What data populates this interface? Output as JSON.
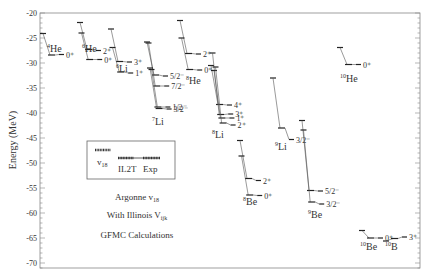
{
  "chart_data": {
    "type": "level-diagram",
    "title": "",
    "ylabel": "Energy (MeV)",
    "xlabel": "",
    "ylim": [
      -72,
      -20
    ],
    "yticks": [
      -20,
      -25,
      -30,
      -35,
      -40,
      -45,
      -50,
      -55,
      -60,
      -65,
      -70
    ],
    "legend": {
      "entries": [
        "v18",
        "IL2T",
        "Exp"
      ],
      "v18_label": "v",
      "v18_sub": "18",
      "il2t_label": "IL2T",
      "exp_label": "Exp"
    },
    "annotations": {
      "line1": "Argonne v",
      "line1_sub": "18",
      "line2": "With Illinois V",
      "line2_sub": "ijk",
      "line3": "GFMC Calculations"
    },
    "nuclei": [
      {
        "name": "4He",
        "mass": "4",
        "element": "He",
        "levels": [
          {
            "J": "0+",
            "v18": -24.1,
            "IL2T": -28.4,
            "Exp": -28.3
          }
        ]
      },
      {
        "name": "6He",
        "mass": "6",
        "element": "He",
        "levels": [
          {
            "J": "2+",
            "v18": -21.9,
            "IL2T": -27.3,
            "Exp": -27.5
          },
          {
            "J": "0+",
            "v18": -24.0,
            "IL2T": -29.3,
            "Exp": -29.3
          }
        ]
      },
      {
        "name": "6Li",
        "mass": "6",
        "element": "Li",
        "levels": [
          {
            "J": "3+",
            "v18": -23.2,
            "IL2T": -29.7,
            "Exp": -29.8
          },
          {
            "J": "1+",
            "v18": -26.9,
            "IL2T": -31.8,
            "Exp": -32.0
          }
        ]
      },
      {
        "name": "7Li",
        "mass": "7",
        "element": "Li",
        "levels": [
          {
            "J": "5/2-",
            "v18": -25.8,
            "IL2T": -32.4,
            "Exp": -32.6
          },
          {
            "J": "7/2-",
            "v18": -26.0,
            "IL2T": -34.6,
            "Exp": -34.6
          },
          {
            "J": "1/2-",
            "v18": -31.0,
            "IL2T": -38.8,
            "Exp": -38.8
          },
          {
            "J": "3/2-",
            "v18": -31.3,
            "IL2T": -39.1,
            "Exp": -39.2
          }
        ]
      },
      {
        "name": "8He",
        "mass": "8",
        "element": "He",
        "levels": [
          {
            "J": "2+",
            "v18": -21.5,
            "IL2T": -28.1,
            "Exp": -28.2
          },
          {
            "J": "0+",
            "v18": -25.0,
            "IL2T": -31.3,
            "Exp": -31.4
          }
        ]
      },
      {
        "name": "8Li",
        "mass": "8",
        "element": "Li",
        "levels": [
          {
            "J": "4+",
            "v18": -30.5,
            "IL2T": -38.3,
            "Exp": -38.4
          },
          {
            "J": "3+",
            "v18": -28.0,
            "IL2T": -40.3,
            "Exp": -40.2
          },
          {
            "J": "1+",
            "v18": -31.5,
            "IL2T": -41.0,
            "Exp": -41.0
          },
          {
            "J": "2+",
            "v18": -30.8,
            "IL2T": -42.0,
            "Exp": -42.4
          }
        ]
      },
      {
        "name": "8Be",
        "mass": "8",
        "element": "Be",
        "levels": [
          {
            "J": "2+",
            "v18": -45.5,
            "IL2T": -53.1,
            "Exp": -53.5
          },
          {
            "J": "0+",
            "v18": -48.6,
            "IL2T": -56.4,
            "Exp": -56.5
          }
        ]
      },
      {
        "name": "9Li",
        "mass": "9",
        "element": "Li",
        "levels": [
          {
            "J": "3/2-",
            "v18": -33.0,
            "IL2T": -43.0,
            "Exp": -45.3
          }
        ]
      },
      {
        "name": "9Be",
        "mass": "9",
        "element": "Be",
        "levels": [
          {
            "J": "5/2-",
            "v18": -41.5,
            "IL2T": -55.5,
            "Exp": -55.6
          },
          {
            "J": "3/2-",
            "v18": -43.4,
            "IL2T": -57.8,
            "Exp": -58.2
          }
        ]
      },
      {
        "name": "10He",
        "mass": "10",
        "element": "He",
        "levels": [
          {
            "J": "0+",
            "v18": -26.9,
            "IL2T": -30.3,
            "Exp": -30.3
          }
        ]
      },
      {
        "name": "10Be",
        "mass": "10",
        "element": "Be",
        "levels": [
          {
            "J": "0+",
            "v18": -63.5,
            "IL2T": -65.0,
            "Exp": -65.0
          }
        ]
      },
      {
        "name": "10B",
        "mass": "10",
        "element": "B",
        "levels": [
          {
            "J": "3+",
            "v18": -65.6,
            "IL2T": -65.1,
            "Exp": -64.8
          }
        ]
      }
    ]
  }
}
